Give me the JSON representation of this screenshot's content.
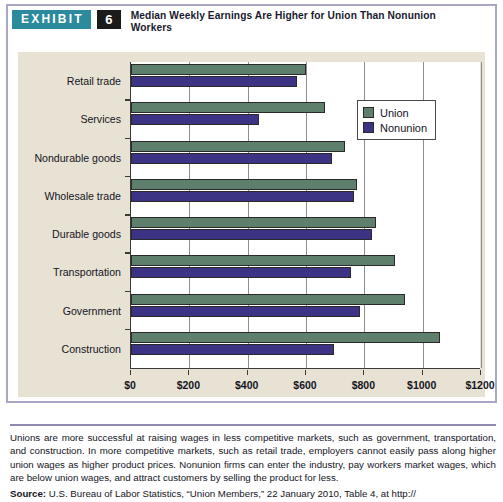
{
  "exhibit": {
    "badge_label": "EXHIBIT",
    "number": "6",
    "title": "Median Weekly Earnings Are Higher for Union Than Nonunion Workers",
    "badge_color": "#2b8a9c",
    "number_bg_color": "#1b1b1b",
    "frame_color": "#a9a6c6",
    "canvas_color": "#e8e2d4"
  },
  "chart_data": {
    "type": "bar",
    "orientation": "horizontal",
    "title": "Median Weekly Earnings Are Higher for Union Than Nonunion Workers",
    "xlabel": "",
    "ylabel": "",
    "xlim": [
      0,
      1200
    ],
    "xticks": [
      0,
      200,
      400,
      600,
      800,
      1000,
      1200
    ],
    "xtick_labels": [
      "$0",
      "$200",
      "$400",
      "$600",
      "$800",
      "$1000",
      "$1200"
    ],
    "grid": true,
    "grid_axis": "x",
    "legend_position": "upper right",
    "categories": [
      "Retail trade",
      "Services",
      "Nondurable goods",
      "Wholesale trade",
      "Durable goods",
      "Transportation",
      "Government",
      "Construction"
    ],
    "series": [
      {
        "name": "Union",
        "color": "#5d7f6c",
        "values": [
          600,
          665,
          735,
          775,
          840,
          905,
          940,
          1060
        ]
      },
      {
        "name": "Nonunion",
        "color": "#3d3384",
        "values": [
          570,
          440,
          690,
          765,
          825,
          755,
          785,
          695
        ]
      }
    ]
  },
  "legend": {
    "items": [
      {
        "label": "Union",
        "color": "#5d7f6c"
      },
      {
        "label": "Nonunion",
        "color": "#3d3384"
      }
    ]
  },
  "caption": {
    "body": "Unions are more successful at raising wages in less competitive markets, such as government, transportation, and construction. In more competitive markets, such as retail trade, employers cannot easily pass along higher union wages as higher product prices. Nonunion firms can enter the industry, pay workers market wages, which are below union wages, and attract customers by selling the product for less.",
    "source_label": "Source:",
    "source_text": " U.S. Bureau of Labor Statistics, “Union Members,” 22 January 2010, Table 4, at http://"
  }
}
